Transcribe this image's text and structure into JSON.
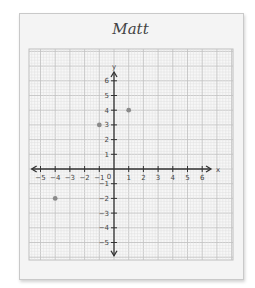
{
  "title": "Matt",
  "chart_data": {
    "type": "scatter",
    "title": "Matt",
    "xlabel": "x",
    "ylabel": "y",
    "xlim": [
      -5,
      6
    ],
    "ylim": [
      -5,
      6
    ],
    "x_ticks": [
      -5,
      -4,
      -3,
      -2,
      -1,
      0,
      1,
      2,
      3,
      4,
      5,
      6
    ],
    "y_ticks": [
      -5,
      -4,
      -3,
      -2,
      -1,
      1,
      2,
      3,
      4,
      5,
      6
    ],
    "grid": true,
    "points": [
      {
        "x": 1,
        "y": 4
      },
      {
        "x": -1,
        "y": 3
      },
      {
        "x": -4,
        "y": -2
      }
    ]
  },
  "colors": {
    "axis": "#333333",
    "major_grid": "#c4c4c4",
    "minor_grid": "#e0e0e0",
    "point": "#8a8a8a"
  }
}
